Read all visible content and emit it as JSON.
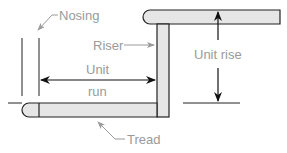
{
  "diagram": {
    "labels": {
      "nosing": "Nosing",
      "riser": "Riser",
      "unit_run_line1": "Unit",
      "unit_run_line2": "run",
      "unit_rise": "Unit rise",
      "tread": "Tread"
    },
    "colors": {
      "stroke": "#222222",
      "fill": "#e6e6e6",
      "label": "#9a9a9a",
      "leader": "#9a9a9a"
    }
  }
}
